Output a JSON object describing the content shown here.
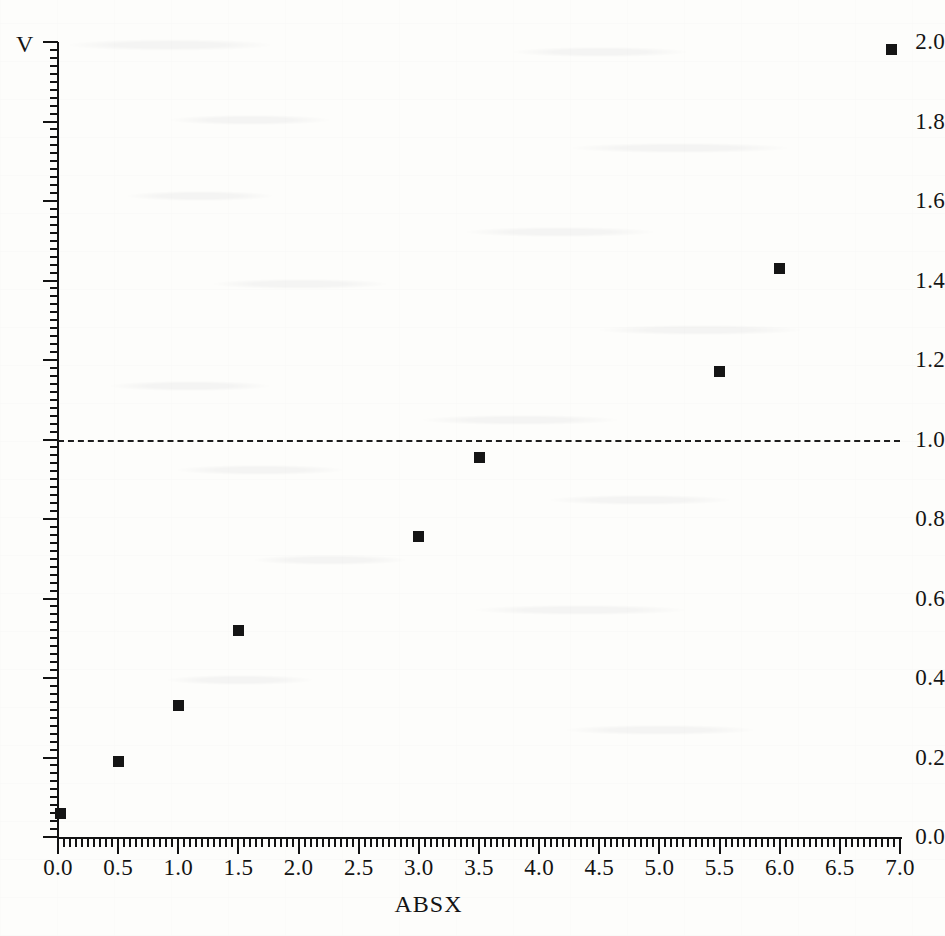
{
  "chart_data": {
    "type": "scatter",
    "title": "",
    "xlabel": "ABSX",
    "ylabel": "V",
    "xlim": [
      0.0,
      7.0
    ],
    "ylim": [
      0.0,
      2.0
    ],
    "grid": false,
    "legend": null,
    "x_tick_labels": [
      "0.0",
      "0.5",
      "1.0",
      "1.5",
      "2.0",
      "2.5",
      "3.0",
      "3.5",
      "4.0",
      "4.5",
      "5.0",
      "5.5",
      "6.0",
      "6.5",
      "7.0"
    ],
    "x_tick_values": [
      0.0,
      0.5,
      1.0,
      1.5,
      2.0,
      2.5,
      3.0,
      3.5,
      4.0,
      4.5,
      5.0,
      5.5,
      6.0,
      6.5,
      7.0
    ],
    "x_minor_tick_step": 0.05,
    "y_tick_labels": [
      "0.0",
      "0.2",
      "0.4",
      "0.6",
      "0.8",
      "1.0",
      "1.2",
      "1.4",
      "1.6",
      "1.8",
      "2.0"
    ],
    "y_tick_values": [
      0.0,
      0.2,
      0.4,
      0.6,
      0.8,
      1.0,
      1.2,
      1.4,
      1.6,
      1.8,
      2.0
    ],
    "y_minor_tick_step": 0.02,
    "marker_style": "filled-square",
    "marker_color": "#151515",
    "x": [
      0.02,
      0.5,
      1.0,
      1.5,
      3.0,
      3.5,
      5.5,
      6.0,
      6.93
    ],
    "y": [
      0.06,
      0.19,
      0.33,
      0.52,
      0.755,
      0.955,
      1.17,
      1.43,
      1.98
    ],
    "points": [
      {
        "x": 0.02,
        "y": 0.06
      },
      {
        "x": 0.5,
        "y": 0.19
      },
      {
        "x": 1.0,
        "y": 0.33
      },
      {
        "x": 1.5,
        "y": 0.52
      },
      {
        "x": 3.0,
        "y": 0.755
      },
      {
        "x": 3.5,
        "y": 0.955
      },
      {
        "x": 5.5,
        "y": 1.17
      },
      {
        "x": 6.0,
        "y": 1.43
      },
      {
        "x": 6.93,
        "y": 1.98
      }
    ],
    "annotations": [
      {
        "kind": "horizontal-reference-line",
        "style": "dashed",
        "y": 1.0,
        "x_start": 0.0,
        "x_end": 7.0,
        "color": "#1d1d1d",
        "label": ""
      }
    ]
  },
  "axes": {
    "y_axis_title": "V",
    "x_axis_title": "ABSX"
  }
}
